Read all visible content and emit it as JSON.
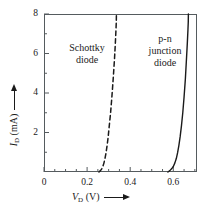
{
  "chart_data": {
    "type": "line",
    "title": "",
    "subtitle": "",
    "xlabel": "V_D (V)",
    "ylabel": "I_D (mA)",
    "xlabel_var": "V",
    "xlabel_sub": "D",
    "xlabel_unit": "(V)",
    "ylabel_var": "I",
    "ylabel_sub": "D",
    "ylabel_unit": "(mA)",
    "xlim": [
      0,
      0.71
    ],
    "ylim": [
      0,
      8
    ],
    "xticks_major": [
      0,
      0.2,
      0.4,
      0.6
    ],
    "xticks_major_labels": [
      "0",
      "0.2",
      "0.4",
      "0.6"
    ],
    "xticks_minor": [
      0.05,
      0.1,
      0.15,
      0.25,
      0.3,
      0.35,
      0.45,
      0.5,
      0.55,
      0.65,
      0.7
    ],
    "yticks_major": [
      2,
      4,
      6,
      8
    ],
    "yticks_major_labels": [
      "2",
      "4",
      "6",
      "8"
    ],
    "yticks_minor": [
      1,
      3,
      5,
      7
    ],
    "grid": false,
    "legend_position": "inline-annotation",
    "axis_arrows": true,
    "frame_color": "#555b5e",
    "curve_color": "#1a1a1a",
    "background": "#ffffff",
    "series": [
      {
        "name": "Schottky diode",
        "style": "dashed",
        "label_lines": "Schottky\ndiode",
        "turn_on_voltage": 0.27,
        "x": [
          0.255,
          0.262,
          0.268,
          0.273,
          0.278,
          0.283,
          0.288,
          0.293,
          0.298,
          0.303,
          0.309,
          0.315,
          0.321,
          0.327,
          0.331,
          0.334,
          0.3355,
          0.336
        ],
        "y": [
          0.0,
          0.07,
          0.16,
          0.28,
          0.45,
          0.68,
          0.98,
          1.35,
          1.8,
          2.35,
          3.0,
          3.8,
          4.7,
          5.7,
          6.5,
          7.2,
          7.6,
          8.0
        ]
      },
      {
        "name": "p-n junction diode",
        "style": "solid",
        "label_lines": "p-n\njunction\ndiode",
        "turn_on_voltage": 0.58,
        "x": [
          0.575,
          0.584,
          0.592,
          0.6,
          0.607,
          0.614,
          0.62,
          0.626,
          0.632,
          0.638,
          0.644,
          0.65,
          0.656,
          0.661,
          0.665,
          0.668,
          0.6695,
          0.67
        ],
        "y": [
          0.0,
          0.07,
          0.16,
          0.28,
          0.45,
          0.68,
          0.98,
          1.35,
          1.8,
          2.35,
          3.0,
          3.8,
          4.7,
          5.7,
          6.5,
          7.2,
          7.6,
          8.0
        ]
      }
    ]
  },
  "annotations": {
    "schottky": "Schottky\ndiode",
    "pn": "p-n\njunction\ndiode"
  }
}
